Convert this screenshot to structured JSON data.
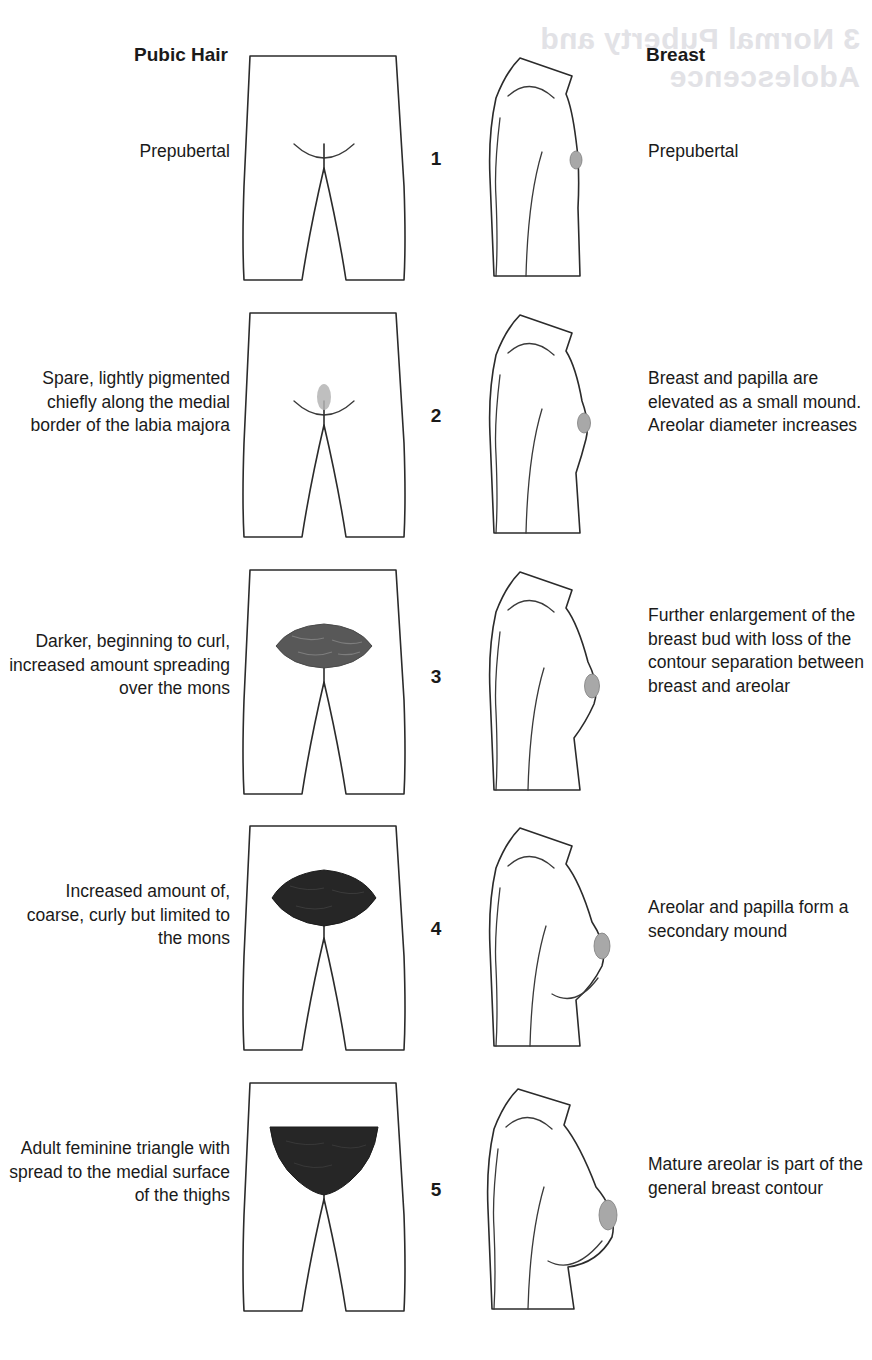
{
  "figure": {
    "columns": {
      "left_header": "Pubic Hair",
      "right_header": "Breast"
    },
    "showthrough_text": {
      "line1": "Normal Puberty and",
      "line2": "Adolescence",
      "number": "3"
    },
    "stages": [
      {
        "number": "1",
        "pubic_hair": "Prepubertal",
        "breast": "Prepubertal",
        "hair_patch": "none",
        "breast_shape": "flat"
      },
      {
        "number": "2",
        "pubic_hair": "Spare, lightly pigmented chiefly along the medial border of the labia majora",
        "breast": "Breast and papilla are elevated as a small mound. Areolar diameter increases",
        "hair_patch": "tiny-light-oval",
        "breast_shape": "small-mound"
      },
      {
        "number": "3",
        "pubic_hair": "Darker, beginning to curl, increased amount spreading over the mons",
        "breast": "Further enlargement of the breast bud with loss of the contour separation between breast and areolar",
        "hair_patch": "medium-gray-lens",
        "breast_shape": "breast-bud"
      },
      {
        "number": "4",
        "pubic_hair": "Increased amount of, coarse, curly but limited to the mons",
        "breast": "Areolar and papilla form a secondary mound",
        "hair_patch": "dark-lens",
        "breast_shape": "secondary-mound"
      },
      {
        "number": "5",
        "pubic_hair": "Adult feminine triangle with spread to the medial surface of the thighs",
        "breast": "Mature areolar is part of the general breast contour",
        "hair_patch": "dark-triangle",
        "breast_shape": "mature"
      }
    ]
  },
  "colors": {
    "ink": "#2b2b2b",
    "hair_light": "#b4b4b4",
    "hair_medium": "#585858",
    "hair_dark": "#262626",
    "papilla": "#a8a8a8",
    "showthrough": "#e2e2e6"
  }
}
